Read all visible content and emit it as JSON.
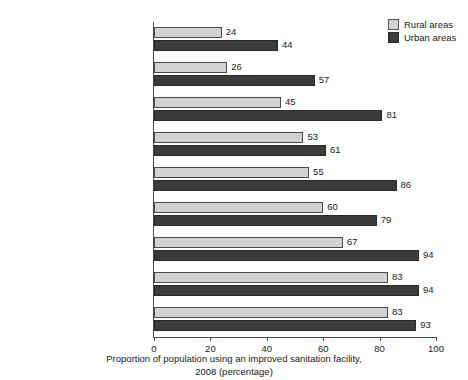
{
  "chart_data": {
    "type": "bar",
    "orientation": "horizontal",
    "title": "",
    "xlabel": "Proportion of population using an improved sanitation facility, 2008 (percentage)",
    "xlabel_line1": "Proportion of population using an improved sanitation facility,",
    "xlabel_line2": "2008 (percentage)",
    "ylabel": "",
    "xlim": [
      0,
      100
    ],
    "xticks": [
      0,
      20,
      40,
      60,
      80,
      100
    ],
    "xtick_labels": [
      "0",
      "20",
      "40",
      "60",
      "80",
      "100"
    ],
    "grid": false,
    "legend_position": "top-right",
    "categories": [
      "Sub-Saharan Africa",
      "Southern Asia",
      "Oceania",
      "Eastern Asia",
      "Latin America and the Caribbean",
      "South-Eastern Asia",
      "Western Asia",
      "Northern Africa",
      "CIS"
    ],
    "series": [
      {
        "name": "Rural areas",
        "color": "#d2d2d2",
        "values": [
          24,
          26,
          45,
          53,
          55,
          60,
          67,
          83,
          83
        ]
      },
      {
        "name": "Urban areas",
        "color": "#3b3b3b",
        "values": [
          44,
          57,
          81,
          61,
          86,
          79,
          94,
          94,
          93
        ]
      }
    ]
  },
  "legend": {
    "items": [
      {
        "label": "Rural areas",
        "color": "#d2d2d2"
      },
      {
        "label": "Urban areas",
        "color": "#3b3b3b"
      }
    ]
  }
}
